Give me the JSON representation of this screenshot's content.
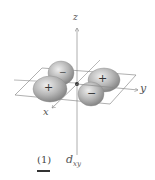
{
  "diagram": {
    "orbital": "d_xy",
    "axes": {
      "z": "z",
      "y": "y",
      "x": "x"
    },
    "lobes": [
      {
        "position": "upper-left",
        "sign": ""
      },
      {
        "position": "left",
        "sign": "+"
      },
      {
        "position": "right",
        "sign": "+"
      },
      {
        "position": "lower-right",
        "sign": "−"
      }
    ],
    "center_sign": "−",
    "caption": {
      "number": "(1)",
      "label_main": "d",
      "label_sub": "xy"
    }
  },
  "colors": {
    "lobe": "#9a9a9a",
    "lobe_highlight": "#e6e6e6",
    "axis": "#8a8a8a",
    "plane": "#7a7a7a"
  }
}
